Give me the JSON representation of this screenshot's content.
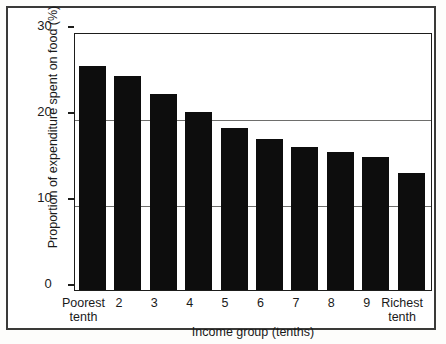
{
  "chart_data": {
    "type": "bar",
    "title": "",
    "xlabel": "Income group (tenths)",
    "ylabel": "Proportion of expenditure spent on food (%)",
    "categories": [
      "Poorest tenth",
      "2",
      "3",
      "4",
      "5",
      "6",
      "7",
      "8",
      "9",
      "Richest tenth"
    ],
    "values": [
      26.0,
      24.9,
      22.8,
      20.7,
      18.8,
      17.6,
      16.6,
      16.0,
      15.5,
      13.6
    ],
    "ylim": [
      0,
      30
    ],
    "yticks": [
      0,
      10,
      20,
      30
    ],
    "ytick_labels": [
      "0",
      "10",
      "20",
      "30"
    ],
    "grid": "horizontal",
    "legend": "none",
    "bar_color": "#0d0d0d"
  },
  "axes": {
    "y_title": "Proportion of expenditure spent on food (%)",
    "x_title": "Income group (tenths)",
    "y_ticks": [
      "30",
      "20",
      "10",
      "0"
    ],
    "x_tick_lines": [
      [
        "Poorest",
        "tenth"
      ],
      [
        "2",
        ""
      ],
      [
        "3",
        ""
      ],
      [
        "4",
        ""
      ],
      [
        "5",
        ""
      ],
      [
        "6",
        ""
      ],
      [
        "7",
        ""
      ],
      [
        "8",
        ""
      ],
      [
        "9",
        ""
      ],
      [
        "Richest",
        "tenth"
      ]
    ]
  }
}
